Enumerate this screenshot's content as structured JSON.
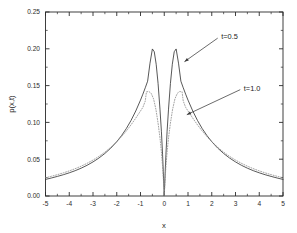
{
  "chart_data": {
    "type": "line",
    "title": "",
    "subtitle": "",
    "xlabel": "x",
    "ylabel": "p(x,t)",
    "xlim": [
      -5,
      5
    ],
    "ylim": [
      0.0,
      0.25
    ],
    "xticks": [
      -5,
      -4,
      -3,
      -2,
      -1,
      0,
      1,
      2,
      3,
      4,
      5
    ],
    "xtick_labels": [
      "-5",
      "-4",
      "-3",
      "-2",
      "-1",
      "0",
      "1",
      "2",
      "3",
      "4",
      "5"
    ],
    "yticks": [
      0.0,
      0.05,
      0.1,
      0.15,
      0.2,
      0.25
    ],
    "ytick_labels": [
      "0.00",
      "0.05",
      "0.10",
      "0.15",
      "0.20",
      "0.25"
    ],
    "x_minor_tick_step": 0.5,
    "y_minor_tick_step": 0.025,
    "grid": false,
    "legend_position": "inline-annotations",
    "frame": "box",
    "series": [
      {
        "name": "t=0.5",
        "style": "solid",
        "color": "#3a3a3a",
        "peak_value": 0.2,
        "peak_positions": [
          -0.6,
          0.6
        ],
        "center_value": 0.0,
        "x": [
          -5.0,
          -4.75,
          -4.5,
          -4.25,
          -4.0,
          -3.75,
          -3.5,
          -3.25,
          -3.0,
          -2.75,
          -2.5,
          -2.25,
          -2.0,
          -1.8,
          -1.6,
          -1.4,
          -1.2,
          -1.0,
          -0.9,
          -0.8,
          -0.7,
          -0.6,
          -0.5,
          -0.42,
          -0.34,
          -0.26,
          -0.18,
          -0.12,
          -0.07,
          -0.04,
          -0.02,
          -0.01,
          0.0,
          0.01,
          0.02,
          0.04,
          0.07,
          0.12,
          0.18,
          0.26,
          0.34,
          0.42,
          0.5,
          0.6,
          0.7,
          0.8,
          0.9,
          1.0,
          1.2,
          1.4,
          1.6,
          1.8,
          2.0,
          2.25,
          2.5,
          2.75,
          3.0,
          3.25,
          3.5,
          3.75,
          4.0,
          4.25,
          4.5,
          4.75,
          5.0
        ],
        "y": [
          0.0225,
          0.0245,
          0.0266,
          0.0289,
          0.0315,
          0.0344,
          0.0378,
          0.0417,
          0.0463,
          0.0516,
          0.0578,
          0.0651,
          0.0738,
          0.082,
          0.0915,
          0.1026,
          0.1155,
          0.1303,
          0.1384,
          0.147,
          0.156,
          0.1805,
          0.1998,
          0.196,
          0.179,
          0.153,
          0.118,
          0.088,
          0.056,
          0.033,
          0.017,
          0.0085,
          0.0,
          0.0085,
          0.017,
          0.033,
          0.056,
          0.088,
          0.118,
          0.153,
          0.179,
          0.196,
          0.1998,
          0.1805,
          0.156,
          0.147,
          0.1384,
          0.1303,
          0.1155,
          0.1026,
          0.0915,
          0.082,
          0.0738,
          0.0651,
          0.0578,
          0.0516,
          0.0463,
          0.0417,
          0.0378,
          0.0344,
          0.0315,
          0.0289,
          0.0266,
          0.0245,
          0.0225
        ]
      },
      {
        "name": "t=1.0",
        "style": "dotted",
        "color": "#8a8a8a",
        "peak_value": 0.142,
        "peak_positions": [
          -0.75,
          0.75
        ],
        "center_value": 0.0,
        "x": [
          -5.0,
          -4.75,
          -4.5,
          -4.25,
          -4.0,
          -3.75,
          -3.5,
          -3.25,
          -3.0,
          -2.75,
          -2.5,
          -2.25,
          -2.0,
          -1.8,
          -1.6,
          -1.4,
          -1.2,
          -1.0,
          -0.9,
          -0.8,
          -0.75,
          -0.65,
          -0.55,
          -0.45,
          -0.35,
          -0.26,
          -0.18,
          -0.12,
          -0.07,
          -0.04,
          -0.02,
          -0.01,
          0.0,
          0.01,
          0.02,
          0.04,
          0.07,
          0.12,
          0.18,
          0.26,
          0.35,
          0.45,
          0.55,
          0.65,
          0.75,
          0.8,
          0.9,
          1.0,
          1.2,
          1.4,
          1.6,
          1.8,
          2.0,
          2.25,
          2.5,
          2.75,
          3.0,
          3.25,
          3.5,
          3.75,
          4.0,
          4.25,
          4.5,
          4.75,
          5.0
        ],
        "y": [
          0.0248,
          0.0268,
          0.029,
          0.0314,
          0.0341,
          0.0371,
          0.0405,
          0.0444,
          0.0488,
          0.0538,
          0.0596,
          0.0662,
          0.0738,
          0.0806,
          0.0882,
          0.0966,
          0.1058,
          0.1155,
          0.1205,
          0.129,
          0.1415,
          0.142,
          0.1395,
          0.132,
          0.1175,
          0.099,
          0.079,
          0.06,
          0.04,
          0.0245,
          0.013,
          0.0065,
          0.0,
          0.0065,
          0.013,
          0.0245,
          0.04,
          0.06,
          0.079,
          0.099,
          0.1175,
          0.132,
          0.1395,
          0.142,
          0.1415,
          0.129,
          0.1205,
          0.1155,
          0.1058,
          0.0966,
          0.0882,
          0.0806,
          0.0738,
          0.0662,
          0.0596,
          0.0538,
          0.0488,
          0.0444,
          0.0405,
          0.0371,
          0.0341,
          0.0314,
          0.029,
          0.0268,
          0.0248
        ]
      }
    ],
    "annotations": [
      {
        "name": "t=0.5",
        "text": "t=0.5",
        "label_x": 2.4,
        "label_y": 0.2175,
        "arrow_from_x": 2.25,
        "arrow_from_y": 0.2145,
        "arrow_to_x": 0.85,
        "arrow_to_y": 0.1825
      },
      {
        "name": "t=1.0",
        "text": "t=1.0",
        "label_x": 3.35,
        "label_y": 0.1465,
        "arrow_from_x": 3.2,
        "arrow_from_y": 0.1445,
        "arrow_to_x": 0.95,
        "arrow_to_y": 0.1105
      }
    ]
  },
  "axes": {
    "x_title": "x",
    "y_title": "p(x,t)"
  },
  "colors": {
    "frame": "#2b2b2b",
    "series_solid": "#3a3a3a",
    "series_dotted": "#8a8a8a",
    "text": "#1d1d1d",
    "background": "#ffffff"
  }
}
